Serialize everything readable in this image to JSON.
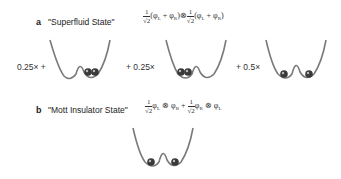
{
  "panel_a": {
    "letter": "a",
    "title": "\"Superfluid State\"",
    "formula": {
      "frac1_num": "1",
      "frac1_den": "√2",
      "term1": "(φ",
      "sub_L1": "L",
      "plus1": " + φ",
      "sub_R1": "R",
      "close1": ")",
      "otimes": "⊗",
      "frac2_num": "1",
      "frac2_den": "√2",
      "term2": "(φ",
      "sub_L2": "L",
      "plus2": " + φ",
      "sub_R2": "R",
      "close2": ")"
    },
    "terms": [
      {
        "coefficient": "0.25× +",
        "balls": "both-right"
      },
      {
        "coefficient": "+ 0.25×",
        "balls": "both-left"
      },
      {
        "coefficient": "+ 0.5×",
        "balls": "one-each"
      }
    ]
  },
  "panel_b": {
    "letter": "b",
    "title": "\"Mott Insulator State\"",
    "formula": {
      "frac1_num": "1",
      "frac1_den": "√2",
      "t1a": "φ",
      "t1a_sub": "L",
      "ot1": " ⊗ ",
      "t1b": "φ",
      "t1b_sub": "R",
      "plus": " + ",
      "frac2_num": "1",
      "frac2_den": "√2",
      "t2a": "φ",
      "t2a_sub": "R",
      "ot2": " ⊗ ",
      "t2b": "φ",
      "t2b_sub": "L"
    },
    "well": {
      "balls": "one-each"
    }
  },
  "colors": {
    "well_line": "#7a7a7a",
    "ball": "#3a3a3a",
    "ball_highlight": "#bbbbbb"
  }
}
